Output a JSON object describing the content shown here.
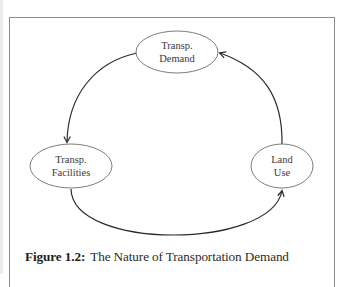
{
  "figure": {
    "number_label": "Figure 1.2:",
    "title": "The Nature of Transportation Demand"
  },
  "nodes": [
    {
      "id": "demand",
      "lines": [
        "Transp.",
        "Demand"
      ]
    },
    {
      "id": "facilities",
      "lines": [
        "Transp.",
        "Facilities"
      ]
    },
    {
      "id": "land_use",
      "lines": [
        "Land",
        "Use"
      ]
    }
  ],
  "edges": [
    {
      "from": "demand",
      "to": "facilities"
    },
    {
      "from": "facilities",
      "to": "land_use"
    },
    {
      "from": "land_use",
      "to": "demand"
    }
  ],
  "colors": {
    "frame": "#8a8a8a",
    "ellipse_stroke": "#6e6e6e",
    "arrow_stroke": "#2a2a2a",
    "text": "#3a3a3a"
  }
}
